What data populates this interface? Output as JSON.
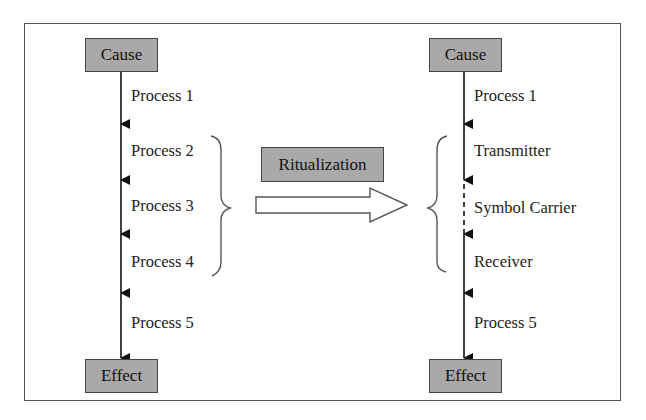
{
  "left_chain": {
    "start": "Cause",
    "end": "Effect",
    "steps": [
      "Process 1",
      "Process 2",
      "Process 3",
      "Process 4",
      "Process 5"
    ]
  },
  "transformation": {
    "label": "Ritualization"
  },
  "right_chain": {
    "start": "Cause",
    "end": "Effect",
    "steps": [
      "Process 1",
      "Transmitter",
      "Symbol Carrier",
      "Receiver",
      "Process 5"
    ]
  },
  "colors": {
    "box_fill": "#a9a9a9",
    "line": "#111111"
  }
}
